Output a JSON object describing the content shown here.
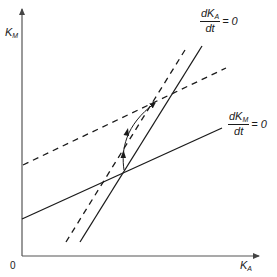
{
  "axes": {
    "y_label_main": "K",
    "y_label_sub": "M",
    "x_label_main": "K",
    "x_label_sub": "A",
    "origin": "0"
  },
  "curves": {
    "ka_nullcline": {
      "numerator_main": "dK",
      "numerator_sub": "A",
      "denominator": "dt",
      "equals": "= 0",
      "style": "solid"
    },
    "km_nullcline": {
      "numerator_main": "dK",
      "numerator_sub": "M",
      "denominator": "dt",
      "equals": "= 0",
      "style": "solid"
    },
    "ka_nullcline_shifted": {
      "style": "dashed"
    },
    "km_nullcline_shifted": {
      "style": "dashed"
    },
    "trajectory": {
      "style": "curved-arrow-path",
      "from": "original-equilibrium",
      "to": "new-equilibrium"
    }
  },
  "colors": {
    "line": "#1a1a1a",
    "axis": "#555555",
    "background": "#ffffff"
  }
}
